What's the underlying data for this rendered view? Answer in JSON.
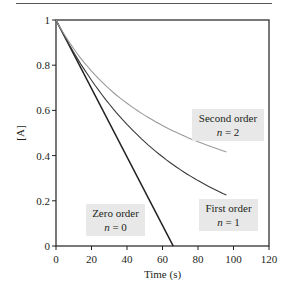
{
  "chart_data": {
    "type": "line",
    "title": "",
    "xlabel": "Time (s)",
    "ylabel": "[A]",
    "xlim": [
      0,
      120
    ],
    "ylim": [
      0,
      1
    ],
    "xticks": [
      0,
      20,
      40,
      60,
      80,
      100,
      120
    ],
    "yticks": [
      0,
      0.2,
      0.4,
      0.6,
      0.8,
      1
    ],
    "ytick_labels": [
      "0",
      "0.2",
      "0.4",
      "0.6",
      "0.8",
      "1"
    ],
    "grid": false,
    "series": [
      {
        "name": "Zero order",
        "order_label": "n = 0",
        "color": "#231f20",
        "x": [
          0,
          66
        ],
        "values": [
          1.0,
          0.0
        ]
      },
      {
        "name": "First order",
        "order_label": "n = 1",
        "color": "#3a3a3a",
        "x": [
          0,
          10,
          20,
          30,
          40,
          50,
          60,
          70,
          80,
          90,
          96
        ],
        "values": [
          1.0,
          0.86,
          0.73,
          0.63,
          0.54,
          0.46,
          0.39,
          0.34,
          0.29,
          0.25,
          0.226
        ]
      },
      {
        "name": "Second order",
        "order_label": "n = 2",
        "color": "#9a9a9a",
        "x": [
          0,
          10,
          20,
          30,
          40,
          50,
          60,
          70,
          80,
          90,
          96
        ],
        "values": [
          1.0,
          0.87,
          0.77,
          0.7,
          0.63,
          0.58,
          0.53,
          0.49,
          0.46,
          0.43,
          0.416
        ]
      }
    ],
    "annotations": [
      {
        "text": "Zero order",
        "sub": "n = 0"
      },
      {
        "text": "First order",
        "sub": "n = 1"
      },
      {
        "text": "Second order",
        "sub": "n = 2"
      }
    ]
  },
  "labels": {
    "zero": {
      "title": "Zero order",
      "n": "n",
      "eq": " = 0"
    },
    "first": {
      "title": "First order",
      "n": "n",
      "eq": " = 1"
    },
    "second": {
      "title": "Second order",
      "n": "n",
      "eq": " = 2"
    }
  }
}
